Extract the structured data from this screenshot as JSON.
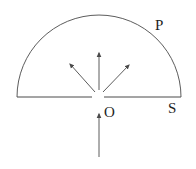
{
  "diagram": {
    "labels": {
      "arc": "P",
      "screen": "S",
      "slit": "O"
    },
    "colors": {
      "line": "#4a4a4a",
      "text": "#1f1f1f",
      "background": "#ffffff"
    }
  }
}
